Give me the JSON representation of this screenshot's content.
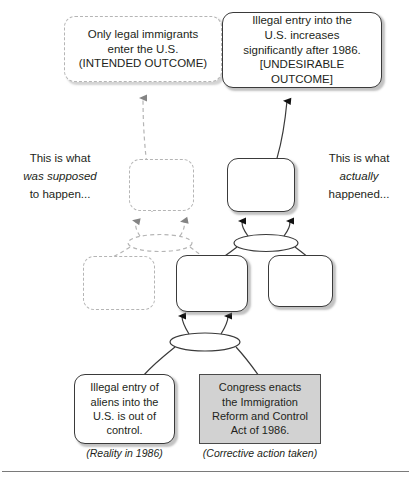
{
  "diagram": {
    "colors": {
      "solid_stroke": "#3a3a3a",
      "ghost_stroke": "#b5b5b5",
      "entity_fill": "#d2d2d2",
      "entity_stroke": "#4a4a4a",
      "text": "#231f20",
      "rule": "#7a7a7a"
    },
    "nodes": [
      {
        "id": "intended-outcome",
        "style": "dashed-rounded",
        "text": "Only legal immigrants\nenter the U.S.\n(INTENDED OUTCOME)"
      },
      {
        "id": "undesirable-outcome",
        "style": "solid-rounded",
        "text": "Illegal entry into the\nU.S. increases\nsignificantly after 1986.\n[UNDESIRABLE OUTCOME]"
      },
      {
        "id": "ghost-intermediate-upper",
        "style": "dashed-rounded",
        "text": ""
      },
      {
        "id": "effect-intermediate-upper",
        "style": "solid-rounded",
        "text": ""
      },
      {
        "id": "ghost-intermediate-lower-left",
        "style": "dashed-rounded",
        "text": ""
      },
      {
        "id": "effect-intermediate-lower-center",
        "style": "solid-rounded",
        "text": ""
      },
      {
        "id": "effect-intermediate-lower-right",
        "style": "solid-rounded",
        "text": ""
      },
      {
        "id": "reality-entity",
        "style": "solid-rounded",
        "text": "Illegal entry of\naliens into the\nU.S. is out of\ncontrol."
      },
      {
        "id": "corrective-action-entity",
        "style": "gray-square",
        "text": "Congress enacts\nthe Immigration\nReform and Control\nAct of 1986."
      }
    ],
    "connectors": [
      {
        "id": "ghost-and-ellipse",
        "style": "dashed-ellipse"
      },
      {
        "id": "upper-and-ellipse",
        "style": "solid-ellipse"
      },
      {
        "id": "lower-and-ellipse",
        "style": "solid-ellipse"
      }
    ],
    "captions": {
      "reality": "(Reality in 1986)",
      "corrective": "(Corrective action taken)"
    },
    "sidenotes": {
      "left": {
        "line1": "This is what",
        "line2": "was supposed",
        "line3": "to happen..."
      },
      "right": {
        "line1": "This is what",
        "line2": "actually",
        "line3": "happened..."
      }
    }
  }
}
